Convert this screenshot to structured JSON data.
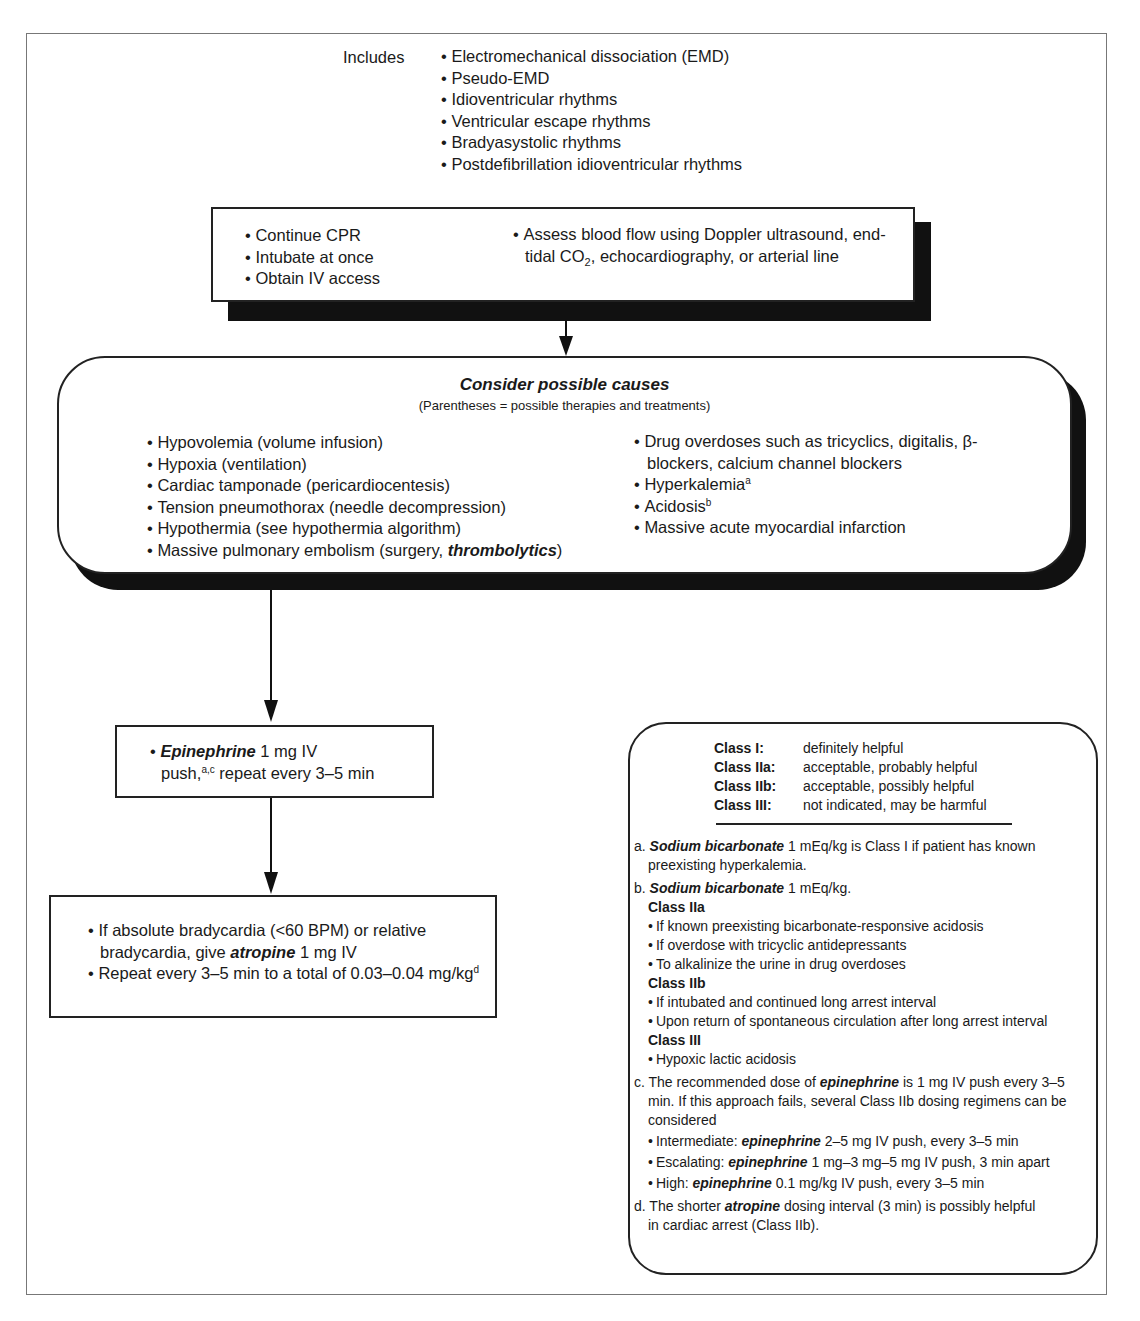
{
  "includes": {
    "label": "Includes",
    "items": [
      "Electromechanical dissociation (EMD)",
      "Pseudo-EMD",
      "Idioventricular rhythms",
      "Ventricular escape rhythms",
      "Bradyasystolic rhythms",
      "Postdefibrillation idioventricular rhythms"
    ]
  },
  "initial_box": {
    "left_items": [
      "Continue CPR",
      "Intubate at once",
      "Obtain IV access"
    ],
    "right_item": {
      "part1": "Assess blood flow using Doppler ultrasound, end-tidal CO",
      "subscript": "2",
      "part2": ", echocardiography, or arterial line"
    }
  },
  "causes": {
    "title": "Consider possible causes",
    "subtitle": "(Parentheses = possible therapies and treatments)",
    "left_items": [
      "Hypovolemia (volume infusion)",
      "Hypoxia (ventilation)",
      "Cardiac tamponade (pericardiocentesis)",
      "Tension pneumothorax (needle decompression)",
      "Hypothermia (see hypothermia algorithm)"
    ],
    "left_last": {
      "prefix": "Massive pulmonary embolism (surgery, ",
      "emphasis": "thrombolytics",
      "suffix": ")"
    },
    "right_items": {
      "drug": "Drug overdoses such as tricyclics, digitalis, β-blockers, calcium channel blockers",
      "hyperkalemia": "Hyperkalemia",
      "hyperkalemia_sup": "a",
      "acidosis": "Acidosis",
      "acidosis_sup": "b",
      "mi": "Massive acute myocardial infarction"
    }
  },
  "epinephrine_box": {
    "drug": "Epinephrine",
    "dose": " 1 mg IV",
    "line2_prefix": "push,",
    "line2_sup": "a,c",
    "line2_suffix": " repeat every 3–5 min"
  },
  "atropine_box": {
    "item1_prefix": "If absolute bradycardia (<60 BPM) or relative bradycardia, give ",
    "item1_drug": "atropine",
    "item1_suffix": " 1 mg IV",
    "item2": "Repeat every 3–5 min to a total of 0.03–0.04 mg/kg",
    "item2_sup": "d"
  },
  "legend": {
    "classes": [
      {
        "key": "Class I:",
        "desc": "definitely helpful"
      },
      {
        "key": "Class IIa:",
        "desc": "acceptable, probably helpful"
      },
      {
        "key": "Class IIb:",
        "desc": "acceptable, possibly helpful"
      },
      {
        "key": "Class III:",
        "desc": "not indicated, may be harmful"
      }
    ],
    "notes": {
      "a": {
        "marker": "a.",
        "drug": "Sodium bicarbonate",
        "text": " 1 mEq/kg is Class I if patient has known preexisting hyperkalemia."
      },
      "b": {
        "marker": "b.",
        "drug": "Sodium bicarbonate",
        "text": " 1 mEq/kg.",
        "groups": [
          {
            "heading": "Class IIa",
            "items": [
              "If known preexisting bicarbonate-responsive acidosis",
              "If overdose with tricyclic antidepressants",
              "To alkalinize the urine in drug overdoses"
            ]
          },
          {
            "heading": "Class IIb",
            "items": [
              "If intubated and continued long arrest interval",
              "Upon return of spontaneous circulation after long arrest interval"
            ]
          },
          {
            "heading": "Class III",
            "items": [
              "Hypoxic lactic acidosis"
            ]
          }
        ]
      },
      "c": {
        "marker": "c.",
        "prefix": "The recommended dose of ",
        "drug": "epinephrine",
        "text": " is 1 mg IV push every 3–5 min. If this approach fails, several Class IIb dosing regimens can be considered",
        "regimens": [
          {
            "label": "Intermediate: ",
            "drug": "epinephrine",
            "text": " 2–5 mg IV push, every 3–5 min"
          },
          {
            "label": "Escalating: ",
            "drug": "epinephrine",
            "text": " 1 mg–3 mg–5 mg IV push, 3 min apart"
          },
          {
            "label": "High: ",
            "drug": "epinephrine",
            "text": " 0.1 mg/kg IV push, every 3–5 min"
          }
        ]
      },
      "d": {
        "marker": "d.",
        "prefix": "The shorter ",
        "drug": "atropine",
        "text": " dosing interval (3 min) is possibly helpful in cardiac arrest (Class IIb)."
      }
    }
  }
}
